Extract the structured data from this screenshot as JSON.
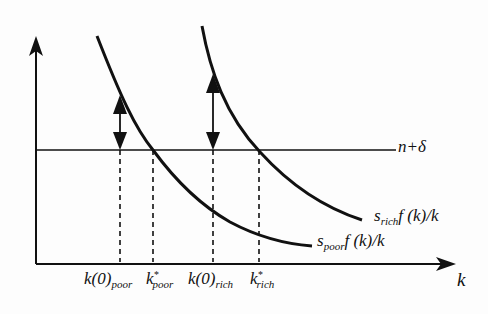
{
  "diagram": {
    "type": "Solow growth convergence diagram",
    "axes": {
      "x_label": "k",
      "y_label": ""
    },
    "horizontal_line": {
      "label": "n+δ"
    },
    "curves": [
      {
        "id": "rich",
        "label_s": "s",
        "label_sub": "rich",
        "label_rest": "f (k)/k"
      },
      {
        "id": "poor",
        "label_s": "s",
        "label_sub": "poor",
        "label_rest": "f (k)/k"
      }
    ],
    "x_ticks": [
      {
        "main": "k(0)",
        "sub": "poor",
        "sup": ""
      },
      {
        "main": "k",
        "sub": "poor",
        "sup": "*"
      },
      {
        "main": "k(0)",
        "sub": "rich",
        "sup": ""
      },
      {
        "main": "k",
        "sub": "rich",
        "sup": "*"
      }
    ],
    "colors": {
      "ink": "#111111",
      "background": "#fdfdfd"
    }
  }
}
